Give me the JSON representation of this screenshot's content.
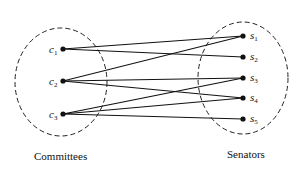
{
  "diagram": {
    "type": "bipartite-graph",
    "left_set": {
      "caption": "Committees",
      "nodes": [
        {
          "id": "c1",
          "base": "c",
          "sub": "1"
        },
        {
          "id": "c2",
          "base": "c",
          "sub": "2"
        },
        {
          "id": "c3",
          "base": "c",
          "sub": "3"
        }
      ]
    },
    "right_set": {
      "caption": "Senators",
      "nodes": [
        {
          "id": "s1",
          "base": "s",
          "sub": "1"
        },
        {
          "id": "s2",
          "base": "s",
          "sub": "2"
        },
        {
          "id": "s3",
          "base": "s",
          "sub": "3"
        },
        {
          "id": "s4",
          "base": "s",
          "sub": "4"
        },
        {
          "id": "s5",
          "base": "s",
          "sub": "5"
        }
      ]
    },
    "edges": [
      [
        "c1",
        "s1"
      ],
      [
        "c1",
        "s2"
      ],
      [
        "c2",
        "s1"
      ],
      [
        "c2",
        "s3"
      ],
      [
        "c2",
        "s4"
      ],
      [
        "c3",
        "s3"
      ],
      [
        "c3",
        "s4"
      ],
      [
        "c3",
        "s5"
      ]
    ],
    "colors": {
      "ink": "#111111",
      "background": "#ffffff"
    }
  }
}
